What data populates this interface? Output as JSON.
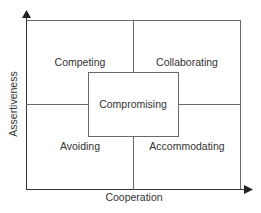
{
  "diagram": {
    "type": "2x2 matrix (Thomas-Kilmann conflict modes)",
    "axes": {
      "x_label": "Cooperation",
      "y_label": "Assertiveness"
    },
    "quadrants": {
      "top_left": "Competing",
      "top_right": "Collaborating",
      "bottom_left": "Avoiding",
      "bottom_right": "Accommodating"
    },
    "center": "Compromising",
    "colors": {
      "line": "#6a6a6a",
      "text": "#333333",
      "background": "#ffffff"
    }
  }
}
